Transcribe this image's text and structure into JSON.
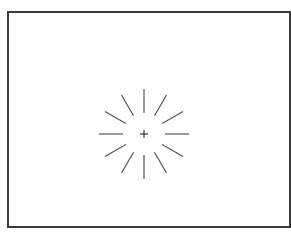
{
  "figure": {
    "type": "fixation-burst-stimulus",
    "center": {
      "x": 144,
      "y": 134
    },
    "fixation_cross": {
      "size": 8,
      "color": "#333333"
    },
    "rays": {
      "count": 12,
      "inner_radius": 21,
      "outer_radius": 45,
      "angles_deg": [
        0,
        30,
        60,
        90,
        120,
        150,
        180,
        210,
        240,
        270,
        300,
        330
      ],
      "color": "#555555",
      "stroke_width": 1.2
    },
    "frame_color": "#3a3a3a"
  }
}
